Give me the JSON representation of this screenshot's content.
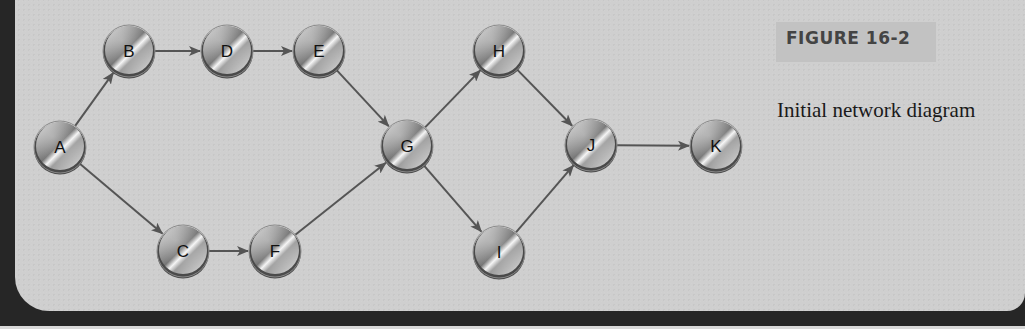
{
  "figure": {
    "label": "FIGURE 16-2",
    "caption": "Initial network diagram"
  },
  "colors": {
    "panel_background": "#cfcfcf",
    "frame_dark": "#262626",
    "edge_color": "#555555",
    "node_rim": "#4a4a4a",
    "label_box": "#c2c2c2"
  },
  "diagram": {
    "type": "network",
    "nodes": [
      {
        "id": "A",
        "label": "A",
        "x": 60,
        "y": 147
      },
      {
        "id": "B",
        "label": "B",
        "x": 129,
        "y": 51
      },
      {
        "id": "D",
        "label": "D",
        "x": 227,
        "y": 51
      },
      {
        "id": "E",
        "label": "E",
        "x": 319,
        "y": 51
      },
      {
        "id": "C",
        "label": "C",
        "x": 183,
        "y": 251
      },
      {
        "id": "F",
        "label": "F",
        "x": 275,
        "y": 251
      },
      {
        "id": "G",
        "label": "G",
        "x": 407,
        "y": 146
      },
      {
        "id": "H",
        "label": "H",
        "x": 499,
        "y": 51
      },
      {
        "id": "I",
        "label": "I",
        "x": 499,
        "y": 252
      },
      {
        "id": "J",
        "label": "J",
        "x": 591,
        "y": 145
      },
      {
        "id": "K",
        "label": "K",
        "x": 716,
        "y": 146
      }
    ],
    "edges": [
      {
        "from": "A",
        "to": "B"
      },
      {
        "from": "A",
        "to": "C"
      },
      {
        "from": "B",
        "to": "D"
      },
      {
        "from": "D",
        "to": "E"
      },
      {
        "from": "E",
        "to": "G"
      },
      {
        "from": "C",
        "to": "F"
      },
      {
        "from": "F",
        "to": "G"
      },
      {
        "from": "G",
        "to": "H"
      },
      {
        "from": "G",
        "to": "I"
      },
      {
        "from": "H",
        "to": "J"
      },
      {
        "from": "I",
        "to": "J"
      },
      {
        "from": "J",
        "to": "K"
      }
    ]
  }
}
